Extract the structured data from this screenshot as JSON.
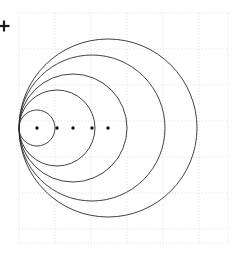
{
  "figure": {
    "background_color": "#ffffff",
    "width": 248,
    "height": 257
  },
  "grid": {
    "visible": true,
    "style": "dotted",
    "color": "#d9d9d9",
    "line_width": 0.8,
    "x_min": 19,
    "x_max": 228,
    "y_min": 13,
    "y_max": 243,
    "cell_size": 36,
    "x_lines": [
      19,
      55,
      91,
      127,
      163,
      199,
      228
    ],
    "y_lines": [
      13,
      49,
      85,
      121,
      157,
      193,
      229,
      243
    ]
  },
  "axis_marker": {
    "name": "origin-cross-marker",
    "symbol": "+",
    "x": 4,
    "y": 26,
    "size": 11,
    "color": "#1a1a1a"
  },
  "chart_data": {
    "type": "scatter",
    "xlabel": "",
    "ylabel": "",
    "grid": true,
    "legend": "none",
    "tangent_point": {
      "x": 19,
      "y": 128
    },
    "stroke_color": "#2b2b2b",
    "stroke_width": 0.9,
    "dot_color": "#111111",
    "dot_radius": 1.7,
    "circles": [
      {
        "id": "circle-1",
        "cx": 37,
        "cy": 128,
        "r": 18,
        "diameter": 36
      },
      {
        "id": "circle-2",
        "cx": 57,
        "cy": 128,
        "r": 38,
        "diameter": 76
      },
      {
        "id": "circle-3",
        "cx": 73,
        "cy": 128,
        "r": 54,
        "diameter": 108
      },
      {
        "id": "circle-4",
        "cx": 92,
        "cy": 128,
        "r": 73,
        "diameter": 146
      },
      {
        "id": "circle-5",
        "cx": 108,
        "cy": 128,
        "r": 89,
        "diameter": 178
      }
    ],
    "center_dots": [
      {
        "id": "dot-1",
        "x": 37,
        "y": 128
      },
      {
        "id": "dot-2",
        "x": 57,
        "y": 128
      },
      {
        "id": "dot-3",
        "x": 73,
        "y": 128
      },
      {
        "id": "dot-4",
        "x": 92,
        "y": 128
      },
      {
        "id": "dot-5",
        "x": 108,
        "y": 128
      }
    ]
  }
}
